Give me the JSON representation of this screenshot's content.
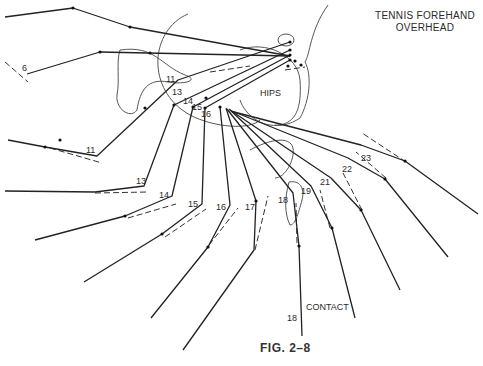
{
  "title": {
    "line1": "TENNIS FOREHAND",
    "line2": "OVERHEAD"
  },
  "caption": "FIG. 2–8",
  "labels": {
    "hips": "HIPS",
    "contact": "CONTACT",
    "frames": [
      {
        "text": "6",
        "x": 22,
        "y": 71
      },
      {
        "text": "11",
        "x": 166,
        "y": 82
      },
      {
        "text": "11",
        "x": 86,
        "y": 153
      },
      {
        "text": "13",
        "x": 172,
        "y": 95
      },
      {
        "text": "13",
        "x": 136,
        "y": 184
      },
      {
        "text": "14",
        "x": 183,
        "y": 104
      },
      {
        "text": "14",
        "x": 159,
        "y": 198
      },
      {
        "text": "15",
        "x": 192,
        "y": 110
      },
      {
        "text": "15",
        "x": 188,
        "y": 207
      },
      {
        "text": "16",
        "x": 201,
        "y": 117
      },
      {
        "text": "16",
        "x": 216,
        "y": 210
      },
      {
        "text": "17",
        "x": 245,
        "y": 210
      },
      {
        "text": "18",
        "x": 278,
        "y": 203
      },
      {
        "text": "19",
        "x": 301,
        "y": 194
      },
      {
        "text": "21",
        "x": 320,
        "y": 185
      },
      {
        "text": "22",
        "x": 342,
        "y": 172
      },
      {
        "text": "23",
        "x": 361,
        "y": 161
      },
      {
        "text": "18",
        "x": 287,
        "y": 321
      }
    ]
  },
  "strokes": [
    {
      "id": "frame-6-upper",
      "points": [
        [
          5,
          17
        ],
        [
          73,
          8
        ],
        [
          130,
          27
        ],
        [
          290,
          56
        ]
      ]
    },
    {
      "id": "frame-6-lower",
      "points": [
        [
          27,
          74
        ],
        [
          100,
          52
        ],
        [
          290,
          56
        ]
      ]
    },
    {
      "id": "frame-11-a",
      "points": [
        [
          8,
          140
        ],
        [
          45,
          147
        ],
        [
          97,
          156
        ],
        [
          178,
          80
        ],
        [
          290,
          42
        ]
      ]
    },
    {
      "id": "frame-13",
      "points": [
        [
          5,
          191
        ],
        [
          95,
          192
        ],
        [
          144,
          186
        ],
        [
          174,
          105
        ],
        [
          290,
          50
        ]
      ]
    },
    {
      "id": "frame-14",
      "points": [
        [
          35,
          240
        ],
        [
          125,
          216
        ],
        [
          172,
          196
        ],
        [
          193,
          107
        ],
        [
          290,
          55
        ]
      ]
    },
    {
      "id": "frame-15",
      "points": [
        [
          84,
          282
        ],
        [
          162,
          234
        ],
        [
          202,
          204
        ],
        [
          205,
          108
        ],
        [
          290,
          60
        ]
      ]
    },
    {
      "id": "frame-16",
      "points": [
        [
          151,
          318
        ],
        [
          208,
          247
        ],
        [
          230,
          205
        ],
        [
          220,
          107
        ]
      ]
    },
    {
      "id": "frame-17",
      "points": [
        [
          183,
          350
        ],
        [
          254,
          250
        ],
        [
          256,
          201
        ],
        [
          226,
          108
        ]
      ]
    },
    {
      "id": "frame-18",
      "points": [
        [
          302,
          336
        ],
        [
          299,
          246
        ],
        [
          293,
          193
        ],
        [
          227,
          109
        ]
      ]
    },
    {
      "id": "frame-19",
      "points": [
        [
          355,
          318
        ],
        [
          332,
          228
        ],
        [
          311,
          186
        ],
        [
          229,
          109
        ]
      ]
    },
    {
      "id": "frame-21",
      "points": [
        [
          400,
          290
        ],
        [
          361,
          210
        ],
        [
          331,
          178
        ],
        [
          230,
          110
        ]
      ]
    },
    {
      "id": "frame-22",
      "points": [
        [
          448,
          257
        ],
        [
          385,
          179
        ],
        [
          348,
          158
        ],
        [
          232,
          111
        ]
      ]
    },
    {
      "id": "frame-23",
      "points": [
        [
          478,
          214
        ],
        [
          405,
          161
        ],
        [
          361,
          145
        ],
        [
          234,
          112
        ]
      ]
    }
  ],
  "dashes": [
    {
      "points": [
        [
          5,
          62
        ],
        [
          28,
          82
        ]
      ]
    },
    {
      "points": [
        [
          50,
          148
        ],
        [
          102,
          163
        ]
      ]
    },
    {
      "points": [
        [
          95,
          193
        ],
        [
          148,
          192
        ]
      ]
    },
    {
      "points": [
        [
          128,
          218
        ],
        [
          176,
          204
        ]
      ]
    },
    {
      "points": [
        [
          165,
          237
        ],
        [
          206,
          209
        ]
      ]
    },
    {
      "points": [
        [
          209,
          245
        ],
        [
          238,
          208
        ]
      ]
    },
    {
      "points": [
        [
          255,
          250
        ],
        [
          268,
          196
        ]
      ]
    },
    {
      "points": [
        [
          297,
          243
        ],
        [
          296,
          203
        ]
      ]
    },
    {
      "points": [
        [
          330,
          228
        ],
        [
          320,
          190
        ]
      ]
    },
    {
      "points": [
        [
          362,
          210
        ],
        [
          343,
          173
        ]
      ]
    },
    {
      "points": [
        [
          386,
          178
        ],
        [
          356,
          152
        ]
      ]
    },
    {
      "points": [
        [
          406,
          162
        ],
        [
          362,
          133
        ]
      ]
    },
    {
      "points": [
        [
          210,
          72
        ],
        [
          250,
          66
        ]
      ]
    },
    {
      "points": [
        [
          285,
          70
        ],
        [
          305,
          67
        ]
      ]
    }
  ],
  "outlines": [
    {
      "id": "torso-outline",
      "d": "M188,14 C150,30 145,90 190,115 C215,128 250,130 260,120"
    },
    {
      "id": "pelvis-outline",
      "d": "M120,50 C155,45 160,65 185,75 C200,80 185,85 168,82 C148,78 140,90 137,110 C130,120 115,108 117,95 C120,80 116,62 120,50 Z"
    },
    {
      "id": "hip-blob-outline",
      "d": "M240,50 C265,40 298,55 300,80 C302,110 295,122 280,125 C262,128 245,115 240,100"
    },
    {
      "id": "shoulder-outline",
      "d": "M328,5 C310,30 310,55 305,62 C312,75 310,100 300,118 C290,125 280,126 275,125"
    },
    {
      "id": "forearm-outline",
      "d": "M250,150 C268,140 290,135 293,148 C295,160 285,178 275,178"
    },
    {
      "id": "hand-outline",
      "d": "M289,182 C300,180 305,188 302,200 C298,215 295,225 290,225 C285,215 284,200 289,182"
    },
    {
      "id": "wrist-circle",
      "d": "M278,40 a8,6 0 1,0 16,0 a8,6 0 1,0 -16,0"
    }
  ],
  "dots": [
    [
      73,
      8
    ],
    [
      130,
      27
    ],
    [
      100,
      52
    ],
    [
      150,
      53
    ],
    [
      45,
      147
    ],
    [
      145,
      108
    ],
    [
      60,
      140
    ],
    [
      174,
      105
    ],
    [
      193,
      107
    ],
    [
      205,
      108
    ],
    [
      220,
      107
    ],
    [
      206,
      98
    ],
    [
      256,
      201
    ],
    [
      299,
      246
    ],
    [
      332,
      228
    ],
    [
      361,
      210
    ],
    [
      385,
      179
    ],
    [
      405,
      161
    ],
    [
      208,
      247
    ],
    [
      162,
      234
    ],
    [
      125,
      216
    ],
    [
      290,
      42
    ],
    [
      290,
      50
    ],
    [
      290,
      55
    ],
    [
      290,
      60
    ],
    [
      288,
      66
    ],
    [
      295,
      61
    ],
    [
      301,
      65
    ]
  ]
}
